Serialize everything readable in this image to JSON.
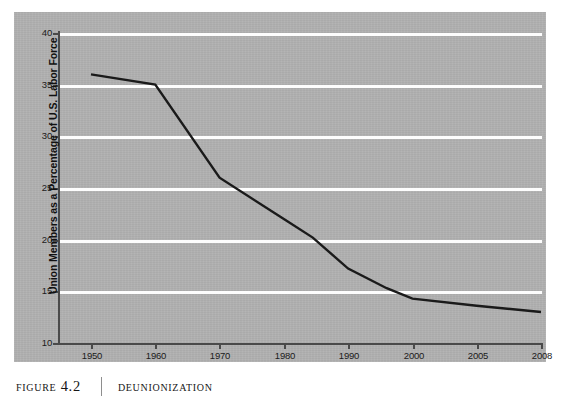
{
  "figure": {
    "label": "Figure 4.2",
    "title": "Deunionization",
    "separator": "|"
  },
  "chart_data": {
    "type": "line",
    "title": "Deunionization",
    "xlabel": "",
    "ylabel": "Union Members as a Percentage of U.S. Labor Force",
    "categories": [
      "1950",
      "1960",
      "1970",
      "1980",
      "1990",
      "2000",
      "2005",
      "2008"
    ],
    "x_tick_labels": [
      "1950",
      "1960",
      "1970",
      "1980",
      "1990",
      "2000",
      "2005",
      "2008"
    ],
    "y_tick_labels": [
      "10",
      "15",
      "20",
      "25",
      "30",
      "35",
      "40"
    ],
    "y_ticks": [
      10,
      15,
      20,
      25,
      30,
      35,
      40
    ],
    "ylim": [
      10,
      40
    ],
    "values": [
      36.0,
      35.0,
      26.0,
      22.0,
      17.2,
      14.3,
      13.6,
      13.0
    ],
    "series": [
      {
        "name": "Union membership rate",
        "categories": [
          "1950",
          "1960",
          "1970",
          "1980",
          "1990",
          "2000",
          "2005",
          "2008"
        ],
        "values": [
          36.0,
          35.0,
          26.0,
          22.0,
          17.2,
          14.3,
          13.6,
          13.0
        ]
      }
    ],
    "interior_points": [
      {
        "category_position": 4.6,
        "value": 15.3
      },
      {
        "category_position": 3.45,
        "value": 20.2
      }
    ],
    "grid": true,
    "gridline_color": "#fdfdfd",
    "legend": "none",
    "line_color": "#1a1a1a",
    "panel_color": "#b0b0b0",
    "note": "Category axis: equal spacing between listed year labels (1950-2008), so 2000, 2005 and 2008 are evenly spaced."
  },
  "colors": {
    "panel": "#b0b0b0",
    "gridline": "#fdfdfd",
    "line": "#1a1a1a",
    "axis": "#4a4a4a",
    "text": "#1b1b1b",
    "caption_text": "#161616"
  }
}
